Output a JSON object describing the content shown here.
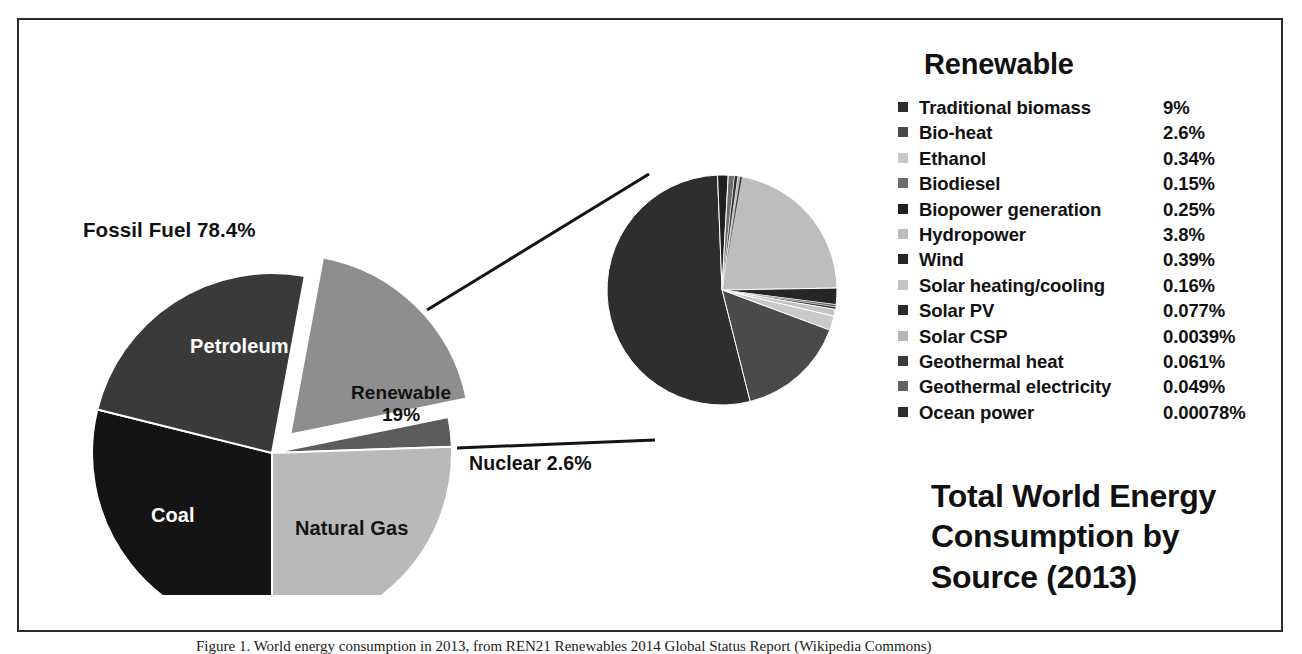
{
  "figure": {
    "title_lines": [
      "Total World Energy",
      "Consumption by",
      "Source (2013)"
    ],
    "title_text": "Total World Energy Consumption by Source (2013)",
    "caption": "Figure 1. World energy consumption in 2013, from REN21 Renewables 2014 Global Status Report (Wikipedia Commons)"
  },
  "main_pie": {
    "labels": {
      "fossil_fuel": "Fossil Fuel  78.4%",
      "petroleum": "Petroleum",
      "coal": "Coal",
      "natural_gas": "Natural Gas",
      "renewable_name": "Renewable",
      "renewable_value": "19%",
      "nuclear": "Nuclear 2.6%"
    }
  },
  "legend": {
    "title": "Renewable",
    "items": [
      {
        "label": "Traditional biomass",
        "value": "9%",
        "color": "#2e2e2e"
      },
      {
        "label": "Bio-heat",
        "value": "2.6%",
        "color": "#4a4a4a"
      },
      {
        "label": "Ethanol",
        "value": "0.34%",
        "color": "#c9c9c9"
      },
      {
        "label": "Biodiesel",
        "value": "0.15%",
        "color": "#6e6e6e"
      },
      {
        "label": "Biopower generation",
        "value": "0.25%",
        "color": "#1f1f1f"
      },
      {
        "label": "Hydropower",
        "value": "3.8%",
        "color": "#bdbdbd"
      },
      {
        "label": "Wind",
        "value": "0.39%",
        "color": "#262626"
      },
      {
        "label": "Solar heating/cooling",
        "value": "0.16%",
        "color": "#c4c4c4"
      },
      {
        "label": "Solar PV",
        "value": "0.077%",
        "color": "#2a2a2a"
      },
      {
        "label": "Solar CSP",
        "value": "0.0039%",
        "color": "#b5b5b5"
      },
      {
        "label": "Geothermal heat",
        "value": "0.061%",
        "color": "#3b3b3b"
      },
      {
        "label": "Geothermal electricity",
        "value": "0.049%",
        "color": "#636363"
      },
      {
        "label": "Ocean power",
        "value": "0.00078%",
        "color": "#2e2e2e"
      }
    ]
  },
  "chart_data": {
    "type": "pie",
    "legend_position": "right",
    "grid": false,
    "charts": [
      {
        "name": "main",
        "note": "Outer pie: primary world energy sources. Renewable slice is exploded and expanded into the secondary pie.",
        "categories": [
          "Petroleum",
          "Coal",
          "Natural Gas",
          "Nuclear",
          "Renewable"
        ],
        "values": [
          31.1,
          28.9,
          21.4,
          2.6,
          19.0
        ],
        "units": "% of total world energy consumption",
        "groups": [
          {
            "name": "Fossil Fuel",
            "value": 78.4,
            "members": [
              "Petroleum",
              "Coal",
              "Natural Gas"
            ]
          },
          {
            "name": "Nuclear",
            "value": 2.6,
            "members": [
              "Nuclear"
            ]
          },
          {
            "name": "Renewable",
            "value": 19.0,
            "members": [
              "Renewable"
            ]
          }
        ],
        "colors": [
          "#3a3a3a",
          "#141414",
          "#b9b9b9",
          "#5c5c5c",
          "#8e8e8e"
        ],
        "exploded": [
          "Renewable"
        ]
      },
      {
        "name": "renewable-breakdown",
        "note": "Secondary pie: breakdown of the 19% Renewable slice (values are % of total world energy).",
        "categories": [
          "Traditional biomass",
          "Bio-heat",
          "Ethanol",
          "Biodiesel",
          "Biopower generation",
          "Hydropower",
          "Wind",
          "Solar heating/cooling",
          "Solar PV",
          "Solar CSP",
          "Geothermal heat",
          "Geothermal electricity",
          "Ocean power"
        ],
        "values": [
          9,
          2.6,
          0.34,
          0.15,
          0.25,
          3.8,
          0.39,
          0.16,
          0.077,
          0.0039,
          0.061,
          0.049,
          0.00078
        ],
        "value_labels": [
          "9%",
          "2.6%",
          "0.34%",
          "0.15%",
          "0.25%",
          "3.8%",
          "0.39%",
          "0.16%",
          "0.077%",
          "0.0039%",
          "0.061%",
          "0.049%",
          "0.00078%"
        ],
        "units": "% of total world energy consumption",
        "total": 19.0,
        "colors": [
          "#2e2e2e",
          "#4a4a4a",
          "#c9c9c9",
          "#6e6e6e",
          "#1f1f1f",
          "#bdbdbd",
          "#262626",
          "#c4c4c4",
          "#2a2a2a",
          "#b5b5b5",
          "#3b3b3b",
          "#636363",
          "#2e2e2e"
        ]
      }
    ]
  }
}
